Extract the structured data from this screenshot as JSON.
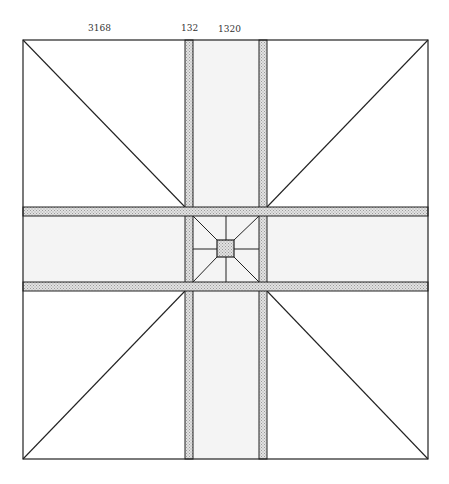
{
  "diagram": {
    "labels": [
      {
        "text": "3168",
        "x": 88,
        "y": 23
      },
      {
        "text": "132",
        "x": 181,
        "y": 23
      },
      {
        "text": "1320",
        "x": 218,
        "y": 24
      }
    ],
    "colors": {
      "line": "#222222",
      "band_fill": "#f4f4f4",
      "strip_fill": "#cfcfcf",
      "background": "#ffffff"
    },
    "frame": {
      "x1": 23,
      "y1": 40,
      "x2": 428,
      "y2": 459
    },
    "vertical_strips": [
      {
        "x1": 185,
        "x2": 193
      },
      {
        "x1": 259,
        "x2": 267
      }
    ],
    "horizontal_strips": [
      {
        "y1": 207,
        "y2": 216
      },
      {
        "y1": 282,
        "y2": 291
      }
    ],
    "center_square": {
      "x1": 217,
      "y1": 240,
      "x2": 234,
      "y2": 257
    }
  }
}
